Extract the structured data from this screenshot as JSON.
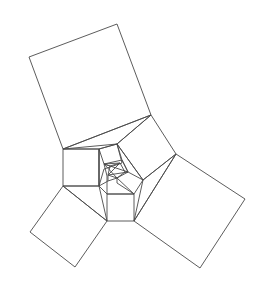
{
  "diagram": {
    "title": "",
    "stroke_color": "#4a4a4a",
    "background_color": "#ffffff",
    "polygons": [
      {
        "name": "large-top-square",
        "points": [
          [
            29,
            57
          ],
          [
            117,
            24
          ],
          [
            151,
            115
          ],
          [
            63,
            149
          ]
        ]
      },
      {
        "name": "left-square",
        "points": [
          [
            63,
            149
          ],
          [
            99,
            149
          ],
          [
            99,
            186
          ],
          [
            63,
            186
          ]
        ]
      },
      {
        "name": "bottom-square",
        "points": [
          [
            107,
            194
          ],
          [
            134,
            194
          ],
          [
            134,
            221
          ],
          [
            107,
            221
          ]
        ]
      },
      {
        "name": "bottom-left-square",
        "points": [
          [
            63,
            186
          ],
          [
            107,
            221
          ],
          [
            75,
            267
          ],
          [
            30,
            232
          ]
        ]
      },
      {
        "name": "right-square",
        "points": [
          [
            176,
            154
          ],
          [
            245,
            199
          ],
          [
            200,
            268
          ],
          [
            134,
            221
          ]
        ]
      },
      {
        "name": "top-triangle",
        "points": [
          [
            63,
            149
          ],
          [
            151,
            115
          ],
          [
            117,
            144
          ]
        ]
      },
      {
        "name": "upper-right-quad",
        "points": [
          [
            117,
            144
          ],
          [
            151,
            115
          ],
          [
            176,
            154
          ],
          [
            143,
            180
          ]
        ]
      },
      {
        "name": "right-triangle",
        "points": [
          [
            143,
            180
          ],
          [
            176,
            154
          ],
          [
            134,
            221
          ]
        ]
      },
      {
        "name": "bottom-left-triangle",
        "points": [
          [
            63,
            186
          ],
          [
            99,
            186
          ],
          [
            107,
            221
          ]
        ]
      },
      {
        "name": "left-pentagon-link",
        "points": [
          [
            99,
            149
          ],
          [
            117,
            144
          ],
          [
            122,
            163
          ],
          [
            104,
            169
          ],
          [
            99,
            186
          ]
        ]
      },
      {
        "name": "core-outer-pentagon",
        "points": [
          [
            99,
            149
          ],
          [
            117,
            144
          ],
          [
            143,
            180
          ],
          [
            134,
            194
          ],
          [
            107,
            194
          ],
          [
            99,
            186
          ]
        ]
      },
      {
        "name": "core-inner-quad-top",
        "points": [
          [
            104,
            164
          ],
          [
            122,
            160
          ],
          [
            128,
            172
          ],
          [
            116,
            168
          ]
        ]
      },
      {
        "name": "core-inner-pentagon",
        "points": [
          [
            110,
            166
          ],
          [
            120,
            163
          ],
          [
            125,
            172
          ],
          [
            117,
            178
          ],
          [
            108,
            175
          ]
        ]
      },
      {
        "name": "core-star-lines",
        "points": [
          [
            104,
            164
          ],
          [
            117,
            178
          ],
          [
            128,
            172
          ],
          [
            108,
            175
          ],
          [
            120,
            163
          ]
        ]
      }
    ]
  }
}
